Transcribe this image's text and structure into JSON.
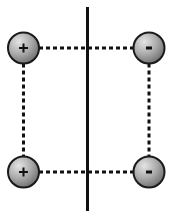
{
  "diagram": {
    "type": "charge-arrangement",
    "colors": {
      "background": "#ffffff",
      "line": "#111111",
      "charge_fill_light": "#e0e0e0",
      "charge_fill_dark": "#7a7a7a",
      "charge_stroke": "#1a1a1a"
    },
    "divider": {
      "label": "vertical solid line",
      "x": 87.5,
      "y1": 7,
      "y2": 211,
      "width": 3
    },
    "charges": [
      {
        "id": "top-left",
        "symbol": "+",
        "polarity": "positive",
        "cx": 23.5,
        "cy": 48,
        "r": 15.5
      },
      {
        "id": "top-right",
        "symbol": "-",
        "polarity": "negative",
        "cx": 149,
        "cy": 48,
        "r": 15.5
      },
      {
        "id": "bottom-left",
        "symbol": "+",
        "polarity": "positive",
        "cx": 23.5,
        "cy": 172,
        "r": 15.5
      },
      {
        "id": "bottom-right",
        "symbol": "-",
        "polarity": "negative",
        "cx": 149,
        "cy": 172,
        "r": 15.5
      }
    ],
    "connectors": [
      {
        "id": "top",
        "style": "dashed",
        "x1": 39,
        "y1": 48,
        "x2": 133.5,
        "y2": 48
      },
      {
        "id": "bottom",
        "style": "dashed",
        "x1": 39,
        "y1": 172,
        "x2": 133.5,
        "y2": 172
      },
      {
        "id": "left",
        "style": "dashed",
        "x1": 23.5,
        "y1": 63.5,
        "x2": 23.5,
        "y2": 156.5
      },
      {
        "id": "right",
        "style": "dashed",
        "x1": 149,
        "y1": 63.5,
        "x2": 149,
        "y2": 156.5
      }
    ],
    "dash_pattern": "4 3",
    "dash_width": 3
  }
}
